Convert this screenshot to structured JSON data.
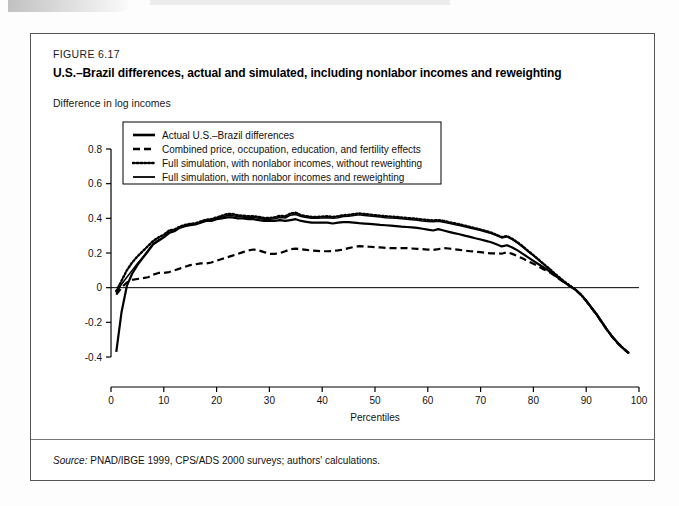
{
  "figure": {
    "number_label": "FIGURE 6.17",
    "title": "U.S.–Brazil differences, actual and simulated, including nonlabor incomes and reweighting",
    "y_axis_caption": "Difference in log incomes",
    "source_prefix": "Source:",
    "source_text": "PNAD/IBGE 1999, CPS/ADS 2000 surveys; authors' calculations."
  },
  "chart_data": {
    "type": "line",
    "title": "U.S.–Brazil differences, actual and simulated, including nonlabor incomes and reweighting",
    "subtitle": "Difference in log incomes",
    "xlabel": "Percentiles",
    "ylabel": "Difference in log incomes",
    "xlim": [
      0,
      100
    ],
    "ylim": [
      -0.4,
      0.8
    ],
    "xticks": [
      0,
      10,
      20,
      30,
      40,
      50,
      60,
      70,
      80,
      90,
      100
    ],
    "xtick_labels": [
      "0",
      "10",
      "20",
      "30",
      "40",
      "50",
      "60",
      "70",
      "80",
      "90",
      "100"
    ],
    "yticks": [
      -0.4,
      -0.2,
      0,
      0.2,
      0.4,
      0.6,
      0.8
    ],
    "ytick_labels": [
      "-0.4",
      "-0.2",
      "0",
      "0.2",
      "0.4",
      "0.6",
      "0.8"
    ],
    "grid": false,
    "zero_line": 0,
    "legend_position": "upper-left",
    "x": [
      1,
      2,
      3,
      4,
      5,
      6,
      7,
      8,
      9,
      10,
      11,
      12,
      13,
      14,
      15,
      16,
      17,
      18,
      19,
      20,
      21,
      22,
      23,
      24,
      25,
      26,
      27,
      28,
      29,
      30,
      31,
      32,
      33,
      34,
      35,
      36,
      37,
      38,
      39,
      40,
      41,
      42,
      43,
      44,
      45,
      46,
      47,
      48,
      49,
      50,
      51,
      52,
      53,
      54,
      55,
      56,
      57,
      58,
      59,
      60,
      61,
      62,
      63,
      64,
      65,
      66,
      67,
      68,
      69,
      70,
      71,
      72,
      73,
      74,
      75,
      76,
      77,
      78,
      79,
      80,
      81,
      82,
      83,
      84,
      85,
      86,
      87,
      88,
      89,
      90,
      91,
      92,
      93,
      94,
      95,
      96,
      97,
      98
    ],
    "series": [
      {
        "name": "Actual U.S.–Brazil differences",
        "style": "solid",
        "width": 2.2,
        "values": [
          -0.37,
          -0.14,
          0.01,
          0.08,
          0.13,
          0.17,
          0.21,
          0.25,
          0.27,
          0.29,
          0.315,
          0.325,
          0.345,
          0.355,
          0.36,
          0.365,
          0.375,
          0.385,
          0.385,
          0.395,
          0.4,
          0.405,
          0.405,
          0.4,
          0.4,
          0.395,
          0.395,
          0.39,
          0.385,
          0.385,
          0.385,
          0.39,
          0.385,
          0.39,
          0.395,
          0.385,
          0.38,
          0.375,
          0.375,
          0.375,
          0.375,
          0.37,
          0.375,
          0.378,
          0.378,
          0.375,
          0.372,
          0.37,
          0.368,
          0.365,
          0.362,
          0.36,
          0.358,
          0.355,
          0.352,
          0.35,
          0.348,
          0.345,
          0.34,
          0.335,
          0.33,
          0.338,
          0.33,
          0.322,
          0.315,
          0.308,
          0.3,
          0.293,
          0.285,
          0.278,
          0.27,
          0.262,
          0.25,
          0.238,
          0.245,
          0.232,
          0.215,
          0.195,
          0.175,
          0.155,
          0.135,
          0.115,
          0.095,
          0.072,
          0.05,
          0.028,
          0.008,
          -0.012,
          -0.04,
          -0.075,
          -0.115,
          -0.155,
          -0.2,
          -0.245,
          -0.285,
          -0.32,
          -0.35,
          -0.375
        ]
      },
      {
        "name": "Combined price, occupation, education, and fertility effects",
        "style": "dashed",
        "width": 2.2,
        "values": [
          -0.04,
          0.0,
          0.03,
          0.045,
          0.05,
          0.055,
          0.06,
          0.075,
          0.085,
          0.085,
          0.09,
          0.1,
          0.11,
          0.12,
          0.13,
          0.135,
          0.14,
          0.14,
          0.145,
          0.155,
          0.165,
          0.175,
          0.185,
          0.195,
          0.205,
          0.215,
          0.22,
          0.215,
          0.205,
          0.195,
          0.195,
          0.2,
          0.21,
          0.222,
          0.225,
          0.222,
          0.218,
          0.214,
          0.212,
          0.21,
          0.21,
          0.212,
          0.215,
          0.22,
          0.228,
          0.235,
          0.24,
          0.238,
          0.236,
          0.234,
          0.232,
          0.23,
          0.228,
          0.228,
          0.228,
          0.228,
          0.226,
          0.224,
          0.222,
          0.22,
          0.218,
          0.222,
          0.228,
          0.226,
          0.222,
          0.218,
          0.214,
          0.21,
          0.208,
          0.205,
          0.2,
          0.198,
          0.198,
          0.196,
          0.205,
          0.195,
          0.182,
          0.168,
          0.152,
          0.138,
          0.122,
          0.105,
          0.09,
          0.07,
          0.048,
          0.027,
          0.007,
          -0.013,
          -0.042,
          -0.077,
          -0.117,
          -0.157,
          -0.202,
          -0.247,
          -0.287,
          -0.322,
          -0.352,
          -0.377
        ]
      },
      {
        "name": "Full simulation, with nonlabor incomes, without reweighting",
        "style": "dotted",
        "width": 2.4,
        "values": [
          -0.02,
          0.04,
          0.1,
          0.145,
          0.18,
          0.21,
          0.24,
          0.27,
          0.29,
          0.305,
          0.33,
          0.335,
          0.352,
          0.362,
          0.368,
          0.372,
          0.382,
          0.392,
          0.395,
          0.405,
          0.415,
          0.425,
          0.425,
          0.418,
          0.415,
          0.412,
          0.412,
          0.408,
          0.402,
          0.402,
          0.405,
          0.415,
          0.412,
          0.428,
          0.432,
          0.418,
          0.412,
          0.408,
          0.408,
          0.41,
          0.412,
          0.408,
          0.412,
          0.418,
          0.42,
          0.425,
          0.428,
          0.425,
          0.422,
          0.418,
          0.415,
          0.412,
          0.41,
          0.408,
          0.405,
          0.402,
          0.4,
          0.397,
          0.393,
          0.39,
          0.388,
          0.39,
          0.385,
          0.378,
          0.372,
          0.365,
          0.358,
          0.35,
          0.343,
          0.335,
          0.327,
          0.318,
          0.305,
          0.292,
          0.298,
          0.282,
          0.262,
          0.238,
          0.212,
          0.188,
          0.162,
          0.135,
          0.11,
          0.082,
          0.057,
          0.032,
          0.01,
          -0.012,
          -0.04,
          -0.075,
          -0.115,
          -0.155,
          -0.2,
          -0.245,
          -0.285,
          -0.32,
          -0.35,
          -0.375
        ]
      },
      {
        "name": "Full simulation, with nonlabor incomes and reweighting",
        "style": "solid-thin",
        "width": 1.5,
        "values": [
          -0.03,
          0.02,
          0.06,
          0.1,
          0.14,
          0.175,
          0.215,
          0.255,
          0.275,
          0.292,
          0.318,
          0.328,
          0.348,
          0.358,
          0.362,
          0.368,
          0.378,
          0.388,
          0.39,
          0.4,
          0.408,
          0.415,
          0.415,
          0.41,
          0.408,
          0.405,
          0.405,
          0.4,
          0.395,
          0.395,
          0.398,
          0.405,
          0.402,
          0.418,
          0.422,
          0.41,
          0.405,
          0.4,
          0.4,
          0.402,
          0.404,
          0.4,
          0.404,
          0.41,
          0.412,
          0.416,
          0.42,
          0.417,
          0.414,
          0.41,
          0.407,
          0.404,
          0.402,
          0.4,
          0.397,
          0.394,
          0.392,
          0.389,
          0.385,
          0.382,
          0.38,
          0.383,
          0.378,
          0.371,
          0.365,
          0.358,
          0.351,
          0.344,
          0.337,
          0.329,
          0.321,
          0.312,
          0.3,
          0.287,
          0.293,
          0.277,
          0.257,
          0.234,
          0.208,
          0.184,
          0.158,
          0.132,
          0.107,
          0.08,
          0.055,
          0.03,
          0.009,
          -0.013,
          -0.041,
          -0.076,
          -0.116,
          -0.156,
          -0.201,
          -0.246,
          -0.286,
          -0.321,
          -0.351,
          -0.376
        ]
      }
    ]
  },
  "legend": {
    "items": [
      {
        "label": "Actual U.S.–Brazil differences",
        "style": "solid"
      },
      {
        "label": "Combined price, occupation, education, and fertility effects",
        "style": "dashed"
      },
      {
        "label": "Full simulation, with nonlabor incomes, without reweighting",
        "style": "dotted"
      },
      {
        "label": "Full simulation, with nonlabor incomes and reweighting",
        "style": "solid-thin"
      }
    ]
  },
  "colors": {
    "ink": "#000000",
    "frame": "#555555",
    "page": "#ffffff"
  }
}
